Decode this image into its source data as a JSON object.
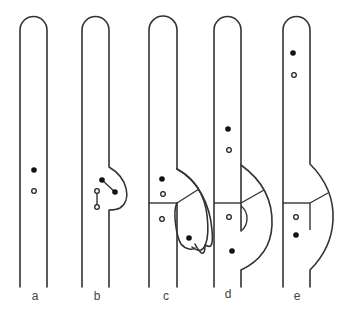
{
  "figure": {
    "panels": [
      {
        "id": "a",
        "label": "a"
      },
      {
        "id": "b",
        "label": "b"
      },
      {
        "id": "c",
        "label": "c"
      },
      {
        "id": "d",
        "label": "d"
      },
      {
        "id": "e",
        "label": "e"
      }
    ],
    "legend_symbols": {
      "filled_dot": "filled circle",
      "open_dot": "open circle"
    },
    "colors": {
      "stroke": "#333333",
      "background": "#ffffff"
    }
  }
}
